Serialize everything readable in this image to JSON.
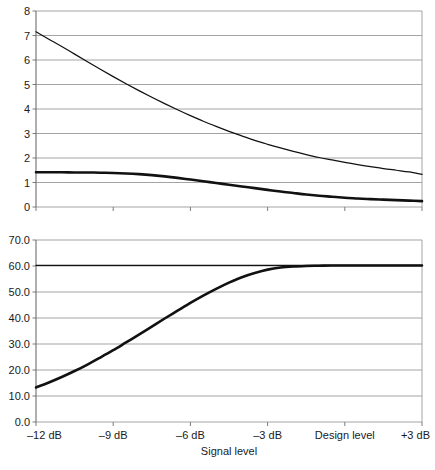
{
  "chart_data": [
    {
      "type": "line",
      "id": "top-chart",
      "title": "",
      "xlabel": "",
      "ylabel": "",
      "grid": true,
      "legend": "none",
      "xlim": [
        -12,
        3
      ],
      "ylim": [
        0,
        8
      ],
      "y_ticks": [
        "0",
        "1",
        "2",
        "3",
        "4",
        "5",
        "6",
        "7",
        "8"
      ],
      "y_tick_values": [
        0,
        1,
        2,
        3,
        4,
        5,
        6,
        7,
        8
      ],
      "x_tick_labels": [
        "–12 dB",
        "–9 dB",
        "–6 dB",
        "–3 dB",
        "Design level",
        "+3 dB"
      ],
      "x_tick_values": [
        -12,
        -9,
        -6,
        -3,
        0,
        3
      ],
      "x": [
        -12,
        -11.5,
        -11,
        -10.5,
        -10,
        -9.5,
        -9,
        -8.5,
        -8,
        -7.5,
        -7,
        -6.5,
        -6,
        -5.5,
        -5,
        -4.5,
        -4,
        -3.5,
        -3,
        -2.5,
        -2,
        -1.5,
        -1,
        -0.5,
        0,
        0.5,
        1,
        1.5,
        2,
        2.5,
        3
      ],
      "series": [
        {
          "name": "upper-curve",
          "style": "thin",
          "values": [
            7.15,
            6.85,
            6.55,
            6.24,
            5.93,
            5.62,
            5.32,
            5.03,
            4.75,
            4.48,
            4.22,
            3.97,
            3.73,
            3.5,
            3.29,
            3.09,
            2.9,
            2.72,
            2.56,
            2.41,
            2.27,
            2.14,
            2.02,
            1.92,
            1.82,
            1.73,
            1.65,
            1.57,
            1.5,
            1.43,
            1.33
          ]
        },
        {
          "name": "lower-curve",
          "style": "thick",
          "values": [
            1.42,
            1.42,
            1.42,
            1.41,
            1.41,
            1.4,
            1.39,
            1.37,
            1.34,
            1.3,
            1.25,
            1.19,
            1.12,
            1.05,
            0.98,
            0.91,
            0.84,
            0.77,
            0.7,
            0.63,
            0.57,
            0.51,
            0.46,
            0.42,
            0.38,
            0.35,
            0.32,
            0.3,
            0.28,
            0.26,
            0.24
          ]
        }
      ]
    },
    {
      "type": "line",
      "id": "bottom-chart",
      "title": "",
      "xlabel": "Signal level",
      "ylabel": "",
      "grid": true,
      "legend": "none",
      "xlim": [
        -12,
        3
      ],
      "ylim": [
        0,
        70
      ],
      "y_ticks": [
        "0.0",
        "10.0",
        "20.0",
        "30.0",
        "40.0",
        "50.0",
        "60.0",
        "70.0"
      ],
      "y_tick_values": [
        0,
        10,
        20,
        30,
        40,
        50,
        60,
        70
      ],
      "x_tick_labels": [
        "–12 dB",
        "–9 dB",
        "–6 dB",
        "–3 dB",
        "Design level",
        "+3 dB"
      ],
      "x_tick_values": [
        -12,
        -9,
        -6,
        -3,
        0,
        3
      ],
      "x": [
        -12,
        -11.5,
        -11,
        -10.5,
        -10,
        -9.5,
        -9,
        -8.5,
        -8,
        -7.5,
        -7,
        -6.5,
        -6,
        -5.5,
        -5,
        -4.5,
        -4,
        -3.5,
        -3,
        -2.5,
        -2,
        -1.5,
        -1,
        -0.5,
        0,
        0.5,
        1,
        1.5,
        2,
        2.5,
        3
      ],
      "series": [
        {
          "name": "saturation-curve",
          "style": "thick",
          "values": [
            13.3,
            15.2,
            17.3,
            19.6,
            22.1,
            24.8,
            27.6,
            30.6,
            33.6,
            36.7,
            39.8,
            42.8,
            45.8,
            48.6,
            51.2,
            53.6,
            55.7,
            57.3,
            58.6,
            59.4,
            59.8,
            60.0,
            60.1,
            60.2,
            60.2,
            60.2,
            60.2,
            60.2,
            60.2,
            60.2,
            60.2
          ]
        },
        {
          "name": "reference-line",
          "style": "thin",
          "values": [
            60.2,
            60.2,
            60.2,
            60.2,
            60.2,
            60.2,
            60.2,
            60.2,
            60.2,
            60.2,
            60.2,
            60.2,
            60.2,
            60.2,
            60.2,
            60.2,
            60.2,
            60.2,
            60.2,
            60.2,
            60.2,
            60.2,
            60.2,
            60.2,
            60.2,
            60.2,
            60.2,
            60.2,
            60.2,
            60.2,
            60.2
          ]
        }
      ]
    }
  ],
  "colors": {
    "grid": "#9a9a9a",
    "axis": "#6e6e6e",
    "curve": "#111111",
    "text": "#1a1a1a",
    "background": "#ffffff"
  }
}
